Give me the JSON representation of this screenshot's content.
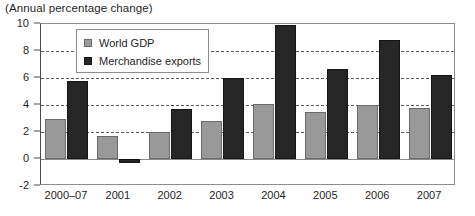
{
  "chart_data": {
    "type": "bar",
    "title": "(Annual percentage change)",
    "xlabel": "",
    "ylabel": "",
    "categories": [
      "2000–07",
      "2001",
      "2002",
      "2003",
      "2004",
      "2005",
      "2006",
      "2007"
    ],
    "series": [
      {
        "name": "World GDP",
        "color": "#999999",
        "values": [
          3.0,
          1.7,
          2.0,
          2.8,
          4.1,
          3.5,
          4.0,
          3.8
        ]
      },
      {
        "name": "Merchandise exports",
        "color": "#262626",
        "values": [
          5.8,
          -0.3,
          3.7,
          6.0,
          9.9,
          6.7,
          8.8,
          6.2
        ]
      }
    ],
    "ylim": [
      -2,
      10
    ],
    "yticks": [
      -2,
      0,
      2,
      4,
      6,
      8,
      10
    ],
    "ytick_labels": [
      "-2",
      "0",
      "2",
      "4",
      "6",
      "8",
      "10"
    ],
    "grid": true,
    "gridlines_at": [
      2,
      4,
      6,
      8
    ],
    "zero_line_at": 0,
    "legend_position": "top-left-inside"
  }
}
